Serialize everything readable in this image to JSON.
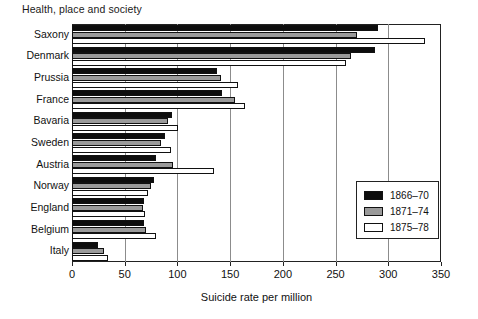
{
  "page_title": "Health, place and society",
  "chart_data": {
    "type": "bar",
    "orientation": "horizontal",
    "title": "",
    "xlabel": "Suicide rate per million",
    "ylabel": "",
    "xlim": [
      0,
      350
    ],
    "xticks": [
      0,
      50,
      100,
      150,
      200,
      250,
      300,
      350
    ],
    "xtick_labels": [
      "0",
      "50",
      "100",
      "150",
      "200",
      "250",
      "300",
      "350"
    ],
    "grid": "vertical",
    "legend_position": "right-middle",
    "categories": [
      "Saxony",
      "Denmark",
      "Prussia",
      "France",
      "Bavaria",
      "Sweden",
      "Austria",
      "Norway",
      "England",
      "Belgium",
      "Italy"
    ],
    "series": [
      {
        "name": "1866–70",
        "color": "#0d0d0d",
        "values": [
          290,
          287,
          138,
          142,
          95,
          88,
          80,
          78,
          68,
          68,
          25
        ]
      },
      {
        "name": "1871–74",
        "color": "#9a9a9a",
        "values": [
          270,
          265,
          141,
          155,
          91,
          84,
          96,
          75,
          67,
          70,
          30
        ]
      },
      {
        "name": "1875–78",
        "color": "#ffffff",
        "values": [
          335,
          260,
          157,
          164,
          101,
          94,
          135,
          72,
          69,
          80,
          34
        ]
      }
    ]
  },
  "legend": {
    "items": [
      {
        "label": "1866–70"
      },
      {
        "label": "1871–74"
      },
      {
        "label": "1875–78"
      }
    ]
  }
}
